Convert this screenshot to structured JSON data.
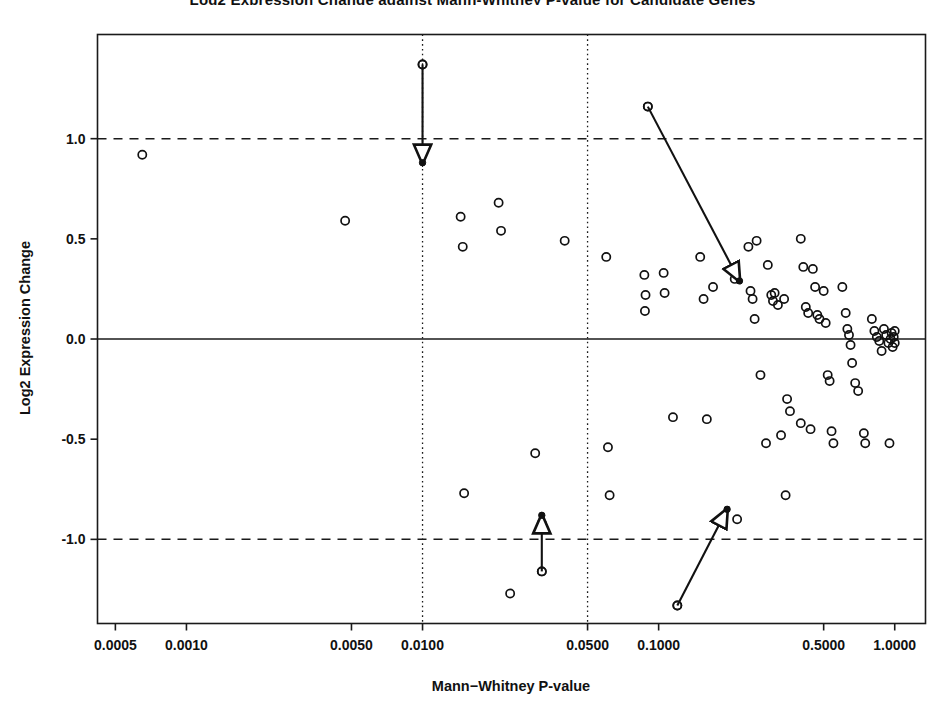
{
  "chart_data": {
    "type": "scatter",
    "title": "Log2 Expression Change against Mann-Whitney P-value for Candidate Genes",
    "xlabel": "Mann−Whitney P-value",
    "ylabel": "Log2 Expression Change",
    "xscale": "log",
    "xlim": [
      0.00042,
      1.35
    ],
    "ylim": [
      -1.42,
      1.52
    ],
    "xticks": [
      0.0005,
      0.001,
      0.005,
      0.01,
      0.05,
      0.1,
      0.5,
      1.0
    ],
    "xtick_labels": [
      "0.0005",
      "0.0010",
      "0.0050",
      "0.0100",
      "0.0500",
      "0.1000",
      "0.5000",
      "1.0000"
    ],
    "yticks": [
      1.0,
      0.5,
      0.0,
      -0.5,
      -1.0
    ],
    "ytick_labels": [
      "1.0",
      "0.5",
      "0.0",
      "-0.5",
      "-1.0"
    ],
    "grid": false,
    "marker": "open-circle",
    "reference_lines": [
      {
        "name": "zero-change-line",
        "axis": "y",
        "value": 0.0,
        "style": "solid"
      },
      {
        "name": "upper-fold-threshold",
        "axis": "y",
        "value": 1.0,
        "style": "dashed"
      },
      {
        "name": "lower-fold-threshold",
        "axis": "y",
        "value": -1.0,
        "style": "dashed"
      },
      {
        "name": "pvalue-threshold-0.01",
        "axis": "x",
        "value": 0.01,
        "style": "dotted"
      },
      {
        "name": "pvalue-threshold-0.05",
        "axis": "x",
        "value": 0.05,
        "style": "dotted"
      }
    ],
    "points": [
      {
        "x": 0.00065,
        "y": 0.92
      },
      {
        "x": 0.0047,
        "y": 0.59
      },
      {
        "x": 0.01,
        "y": 1.37
      },
      {
        "x": 0.0145,
        "y": 0.61
      },
      {
        "x": 0.0148,
        "y": 0.46
      },
      {
        "x": 0.021,
        "y": 0.68
      },
      {
        "x": 0.0215,
        "y": 0.54
      },
      {
        "x": 0.03,
        "y": -0.57
      },
      {
        "x": 0.015,
        "y": -0.77
      },
      {
        "x": 0.0235,
        "y": -1.27
      },
      {
        "x": 0.04,
        "y": 0.49
      },
      {
        "x": 0.032,
        "y": -0.92
      },
      {
        "x": 0.032,
        "y": -1.16
      },
      {
        "x": 0.06,
        "y": 0.41
      },
      {
        "x": 0.061,
        "y": -0.54
      },
      {
        "x": 0.062,
        "y": -0.78
      },
      {
        "x": 0.09,
        "y": 1.16
      },
      {
        "x": 0.087,
        "y": 0.32
      },
      {
        "x": 0.088,
        "y": 0.22
      },
      {
        "x": 0.0875,
        "y": 0.14
      },
      {
        "x": 0.105,
        "y": 0.33
      },
      {
        "x": 0.106,
        "y": 0.23
      },
      {
        "x": 0.115,
        "y": -0.39
      },
      {
        "x": 0.12,
        "y": -1.33
      },
      {
        "x": 0.15,
        "y": 0.41
      },
      {
        "x": 0.155,
        "y": 0.2
      },
      {
        "x": 0.17,
        "y": 0.26
      },
      {
        "x": 0.16,
        "y": -0.4
      },
      {
        "x": 0.21,
        "y": 0.3
      },
      {
        "x": 0.215,
        "y": -0.9
      },
      {
        "x": 0.24,
        "y": 0.46
      },
      {
        "x": 0.26,
        "y": 0.49
      },
      {
        "x": 0.245,
        "y": 0.24
      },
      {
        "x": 0.25,
        "y": 0.2
      },
      {
        "x": 0.255,
        "y": 0.1
      },
      {
        "x": 0.27,
        "y": -0.18
      },
      {
        "x": 0.29,
        "y": 0.37
      },
      {
        "x": 0.3,
        "y": 0.22
      },
      {
        "x": 0.305,
        "y": 0.19
      },
      {
        "x": 0.31,
        "y": 0.23
      },
      {
        "x": 0.32,
        "y": 0.17
      },
      {
        "x": 0.285,
        "y": -0.52
      },
      {
        "x": 0.34,
        "y": 0.2
      },
      {
        "x": 0.35,
        "y": -0.3
      },
      {
        "x": 0.36,
        "y": -0.36
      },
      {
        "x": 0.33,
        "y": -0.48
      },
      {
        "x": 0.345,
        "y": -0.78
      },
      {
        "x": 0.4,
        "y": 0.5
      },
      {
        "x": 0.41,
        "y": 0.36
      },
      {
        "x": 0.42,
        "y": 0.16
      },
      {
        "x": 0.43,
        "y": 0.13
      },
      {
        "x": 0.4,
        "y": -0.42
      },
      {
        "x": 0.44,
        "y": -0.45
      },
      {
        "x": 0.45,
        "y": 0.35
      },
      {
        "x": 0.46,
        "y": 0.26
      },
      {
        "x": 0.47,
        "y": 0.12
      },
      {
        "x": 0.48,
        "y": 0.1
      },
      {
        "x": 0.5,
        "y": 0.24
      },
      {
        "x": 0.51,
        "y": 0.08
      },
      {
        "x": 0.52,
        "y": -0.18
      },
      {
        "x": 0.53,
        "y": -0.21
      },
      {
        "x": 0.54,
        "y": -0.46
      },
      {
        "x": 0.55,
        "y": -0.52
      },
      {
        "x": 0.6,
        "y": 0.26
      },
      {
        "x": 0.62,
        "y": 0.13
      },
      {
        "x": 0.63,
        "y": 0.05
      },
      {
        "x": 0.64,
        "y": 0.02
      },
      {
        "x": 0.65,
        "y": -0.03
      },
      {
        "x": 0.66,
        "y": -0.12
      },
      {
        "x": 0.68,
        "y": -0.22
      },
      {
        "x": 0.7,
        "y": -0.26
      },
      {
        "x": 0.74,
        "y": -0.47
      },
      {
        "x": 0.75,
        "y": -0.52
      },
      {
        "x": 0.8,
        "y": 0.1
      },
      {
        "x": 0.82,
        "y": 0.04
      },
      {
        "x": 0.84,
        "y": 0.01
      },
      {
        "x": 0.86,
        "y": -0.01
      },
      {
        "x": 0.88,
        "y": -0.06
      },
      {
        "x": 0.9,
        "y": 0.05
      },
      {
        "x": 0.92,
        "y": 0.02
      },
      {
        "x": 0.94,
        "y": -0.02
      },
      {
        "x": 0.96,
        "y": 0.0
      },
      {
        "x": 0.97,
        "y": 0.03
      },
      {
        "x": 0.98,
        "y": -0.04
      },
      {
        "x": 0.99,
        "y": 0.01
      },
      {
        "x": 1.0,
        "y": -0.02
      },
      {
        "x": 0.95,
        "y": -0.52
      },
      {
        "x": 1.0,
        "y": 0.04
      }
    ],
    "annotations": [
      {
        "name": "shift-arrow-down",
        "from": {
          "x": 0.01,
          "y": 1.37
        },
        "to": {
          "x": 0.01,
          "y": 0.88
        },
        "direction": "down"
      },
      {
        "name": "shift-arrow-downright",
        "from": {
          "x": 0.09,
          "y": 1.16
        },
        "to": {
          "x": 0.22,
          "y": 0.29
        },
        "direction": "down-right"
      },
      {
        "name": "shift-arrow-up",
        "from": {
          "x": 0.032,
          "y": -1.16
        },
        "to": {
          "x": 0.032,
          "y": -0.88
        },
        "direction": "up"
      },
      {
        "name": "shift-arrow-upright",
        "from": {
          "x": 0.12,
          "y": -1.33
        },
        "to": {
          "x": 0.195,
          "y": -0.85
        },
        "direction": "up-right"
      }
    ]
  },
  "figure": {
    "background_color": "#ffffff",
    "axis_color": "#1a1a1a",
    "point_color": "#111111"
  }
}
